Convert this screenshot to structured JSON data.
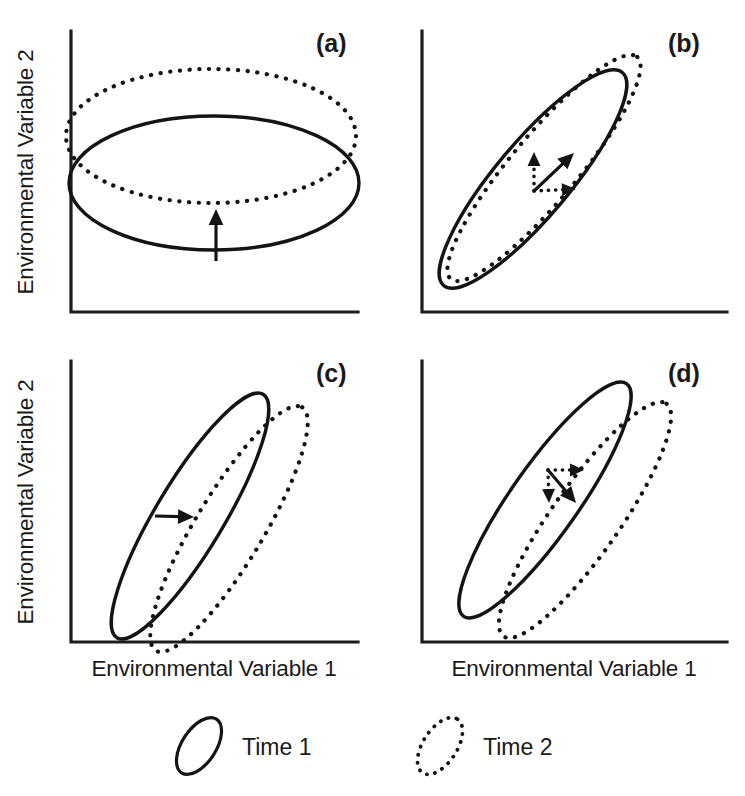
{
  "figure": {
    "type": "scientific-diagram",
    "stroke_color": "#141414",
    "background_color": "#ffffff"
  },
  "axes": {
    "x_label": "Environmental Variable 1",
    "y_label": "Environmental Variable 2"
  },
  "panels": [
    {
      "id": "a",
      "label": "(a)",
      "label_x": 316,
      "label_y": 52,
      "axis": {
        "x0": 71,
        "y0": 312,
        "x1": 358,
        "ytop": 31
      },
      "ellipse_time1": {
        "cx": 214,
        "cy": 183,
        "rx": 145,
        "ry": 67,
        "rot": 0
      },
      "ellipse_time2": {
        "cx": 211,
        "cy": 136,
        "rx": 145,
        "ry": 67,
        "rot": 0
      },
      "arrows": [
        {
          "style": "solid",
          "x1": 216,
          "y1": 261,
          "x2": 216,
          "y2": 209
        }
      ]
    },
    {
      "id": "b",
      "label": "(b)",
      "label_x": 668,
      "label_y": 52,
      "axis": {
        "x0": 422,
        "y0": 312,
        "x1": 727,
        "ytop": 31
      },
      "ellipse_time1": {
        "cx": 533,
        "cy": 179,
        "rx": 139,
        "ry": 37,
        "rot": -50
      },
      "ellipse_time2": {
        "cx": 544,
        "cy": 168,
        "rx": 145,
        "ry": 33,
        "rot": -50
      },
      "arrows": [
        {
          "style": "dotted",
          "x1": 534,
          "y1": 191,
          "x2": 534,
          "y2": 152
        },
        {
          "style": "solid",
          "x1": 534,
          "y1": 191,
          "x2": 574,
          "y2": 153
        },
        {
          "style": "dotted",
          "x1": 534,
          "y1": 191,
          "x2": 576,
          "y2": 189
        }
      ]
    },
    {
      "id": "c",
      "label": "(c)",
      "label_x": 316,
      "label_y": 382,
      "axis": {
        "x0": 71,
        "y0": 642,
        "x1": 358,
        "ytop": 361
      },
      "ellipse_time1": {
        "cx": 190,
        "cy": 516,
        "rx": 142,
        "ry": 34,
        "rot": -59
      },
      "ellipse_time2": {
        "cx": 229,
        "cy": 529,
        "rx": 142,
        "ry": 34,
        "rot": -59
      },
      "arrows": [
        {
          "style": "solid",
          "x1": 155,
          "y1": 516,
          "x2": 194,
          "y2": 517
        }
      ]
    },
    {
      "id": "d",
      "label": "(d)",
      "label_x": 668,
      "label_y": 382,
      "axis": {
        "x0": 422,
        "y0": 642,
        "x1": 727,
        "ytop": 361
      },
      "ellipse_time1": {
        "cx": 545,
        "cy": 500,
        "rx": 142,
        "ry": 34,
        "rot": -55
      },
      "ellipse_time2": {
        "cx": 585,
        "cy": 520,
        "rx": 142,
        "ry": 34,
        "rot": -55
      },
      "arrows": [
        {
          "style": "dotted",
          "x1": 548,
          "y1": 470,
          "x2": 584,
          "y2": 470
        },
        {
          "style": "dotted",
          "x1": 548,
          "y1": 470,
          "x2": 549,
          "y2": 503
        },
        {
          "style": "solid",
          "x1": 548,
          "y1": 470,
          "x2": 576,
          "y2": 503
        }
      ]
    }
  ],
  "axis_titles": [
    {
      "text": "Environmental Variable 1",
      "x": 214,
      "y": 676
    },
    {
      "text": "Environmental Variable 1",
      "x": 574,
      "y": 676
    },
    {
      "text": "Environmental Variable 2",
      "x": 33,
      "y": 172,
      "rotated": true
    },
    {
      "text": "Environmental Variable 2",
      "x": 33,
      "y": 502,
      "rotated": true
    }
  ],
  "legend": {
    "items": [
      {
        "key": "time1",
        "label": "Time 1",
        "style": "solid",
        "swatch": {
          "cx": 199,
          "cy": 746,
          "rx": 32,
          "ry": 17,
          "rot": -57
        },
        "text_x": 242,
        "text_y": 755
      },
      {
        "key": "time2",
        "label": "Time 2",
        "style": "dotted",
        "swatch": {
          "cx": 440,
          "cy": 746,
          "rx": 32,
          "ry": 17,
          "rot": -57
        },
        "text_x": 483,
        "text_y": 755
      }
    ]
  }
}
